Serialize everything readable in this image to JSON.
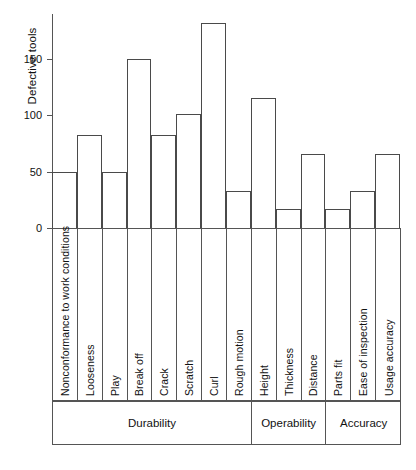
{
  "chart_data": {
    "type": "bar",
    "title": "",
    "xlabel": "",
    "ylabel": "Defective tools",
    "ylim": [
      0,
      190
    ],
    "yticks": [
      0,
      50,
      100,
      150
    ],
    "grid": false,
    "legend": "none",
    "categories": [
      "Nonconformance to work conditions",
      "Looseness",
      "Play",
      "Break off",
      "Crack",
      "Scratch",
      "Curl",
      "Rough motion",
      "Height",
      "Thickness",
      "Distance",
      "Parts fit",
      "Ease of inspection",
      "Usage accuracy"
    ],
    "values": [
      50,
      83,
      50,
      150,
      83,
      101,
      182,
      33,
      115,
      17,
      66,
      17,
      33,
      66
    ],
    "groups": [
      {
        "label": "Durability",
        "span": 8
      },
      {
        "label": "Operability",
        "span": 3
      },
      {
        "label": "Accuracy",
        "span": 3
      }
    ],
    "colors": {
      "bar_stroke": "#4a4a4a",
      "bar_fill": "transparent",
      "axis": "#555555",
      "text": "#111111",
      "background": "#ffffff"
    }
  }
}
